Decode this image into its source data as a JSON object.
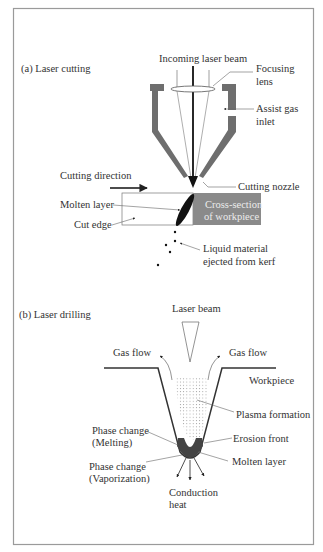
{
  "panel_a": {
    "title": "(a) Laser cutting",
    "labels": {
      "incoming_beam": "Incoming laser beam",
      "focusing_lens_1": "Focusing",
      "focusing_lens_2": "lens",
      "assist_gas_1": "Assist gas",
      "assist_gas_2": "inlet",
      "cutting_direction": "Cutting direction",
      "cutting_nozzle": "Cutting nozzle",
      "molten_layer": "Molten layer",
      "cut_edge": "Cut edge",
      "cross_section_1": "Cross-section",
      "cross_section_2": "of workpiece",
      "liquid_material_1": "Liquid material",
      "liquid_material_2": "ejected from kerf"
    }
  },
  "panel_b": {
    "title": "(b) Laser drilling",
    "labels": {
      "laser_beam": "Laser beam",
      "gas_flow_left": "Gas flow",
      "gas_flow_right": "Gas flow",
      "workpiece": "Workpiece",
      "plasma_formation": "Plasma formation",
      "phase_melting_1": "Phase change",
      "phase_melting_2": "(Melting)",
      "erosion_front": "Erosion front",
      "phase_vapor_1": "Phase change",
      "phase_vapor_2": "(Vaporization)",
      "molten_layer": "Molten layer",
      "conduction_1": "Conduction",
      "conduction_2": "heat"
    }
  },
  "colors": {
    "nozzle": "#6e6e6e",
    "workpiece": "#8a8a8a",
    "ink": "#222222",
    "frame": "#9a9a9a"
  }
}
